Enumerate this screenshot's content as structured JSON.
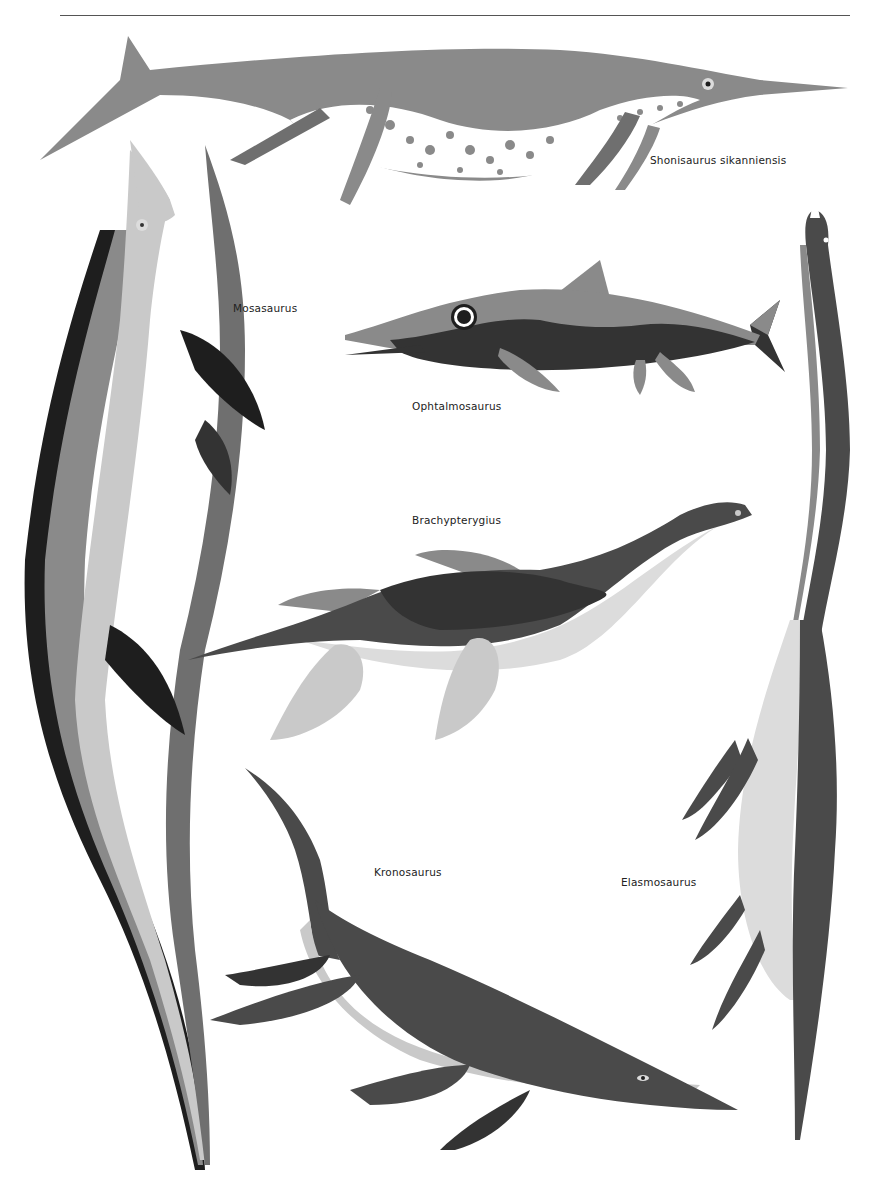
{
  "page": {
    "background": "#ffffff",
    "rule_color": "#555555"
  },
  "palette": {
    "light": "#c9c9c9",
    "pale": "#dcdcdc",
    "mid": "#8a8a8a",
    "mid_dark": "#6f6f6f",
    "dark": "#4a4a4a",
    "darker": "#333333",
    "black": "#1e1e1e",
    "white": "#ffffff"
  },
  "labels": {
    "shonisaurus": "Shonisaurus sikanniensis",
    "mosasaurus": "Mosasaurus",
    "ophtalmosaurus": "Ophtalmosaurus",
    "brachypterygius": "Brachypterygius",
    "kronosaurus": "Kronosaurus",
    "elasmosaurus": "Elasmosaurus"
  }
}
